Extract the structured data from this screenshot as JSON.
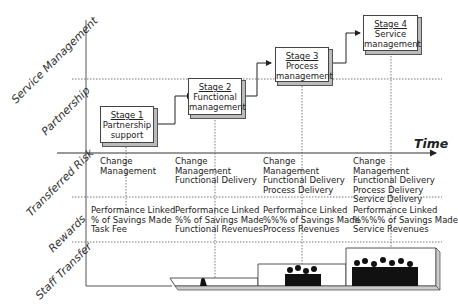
{
  "diagram": {
    "axis_rows": [
      {
        "label": "Service Management"
      },
      {
        "label": "Partnership"
      },
      {
        "label": "Transferred Risk"
      },
      {
        "label": "Rewards"
      },
      {
        "label": "Staff Transfer"
      }
    ],
    "time_axis_label": "Time",
    "stages": [
      {
        "title": "Stage 1",
        "line1": "Partnership",
        "line2": "support"
      },
      {
        "title": "Stage 2",
        "line1": "Functional",
        "line2": "management"
      },
      {
        "title": "Stage 3",
        "line1": "Process",
        "line2": "management"
      },
      {
        "title": "Stage 4",
        "line1": "Service",
        "line2": "management"
      }
    ],
    "transferred_risk": [
      [
        "Change",
        "Management"
      ],
      [
        "Change",
        "Management",
        "Functional Delivery"
      ],
      [
        "Change",
        "Management",
        "Functional Delivery",
        "Process Delivery"
      ],
      [
        "Change",
        "Management",
        "Functional Delivery",
        "Process Delivery",
        "Service Delivery"
      ]
    ],
    "rewards": [
      [
        "Performance Linked",
        "% of Savings Made",
        "Task Fee"
      ],
      [
        "Performance Linked",
        "%% of Savings Made",
        "Functional Revenues"
      ],
      [
        "Performance Linked",
        "%%% of Savings Made",
        "Process Revenues"
      ],
      [
        "Performance Linked",
        "%%%% of Savings Made",
        "Service Revenues"
      ]
    ],
    "staff_transfer_levels": [
      "small",
      "one person",
      "group",
      "large group"
    ]
  }
}
